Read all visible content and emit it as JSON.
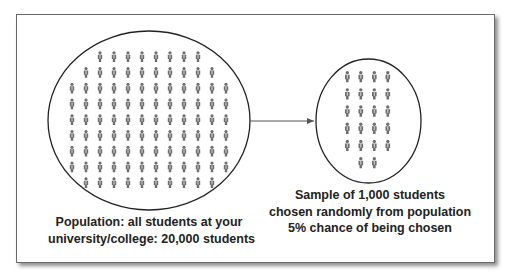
{
  "diagram": {
    "colors": {
      "frame_border": "#6a6a6a",
      "ellipse_stroke": "#222222",
      "arrow": "#555555",
      "figure": "#6e6e6e",
      "text": "#222222"
    },
    "population": {
      "icon": "person-icon",
      "rows": [
        8,
        10,
        12,
        12,
        12,
        12,
        12,
        12,
        10
      ],
      "caption_lines": [
        "Population: all students at your",
        "university/college: 20,000 students"
      ]
    },
    "arrow": {
      "icon": "arrow-right-icon",
      "direction": "population-to-sample"
    },
    "sample": {
      "icon": "person-icon",
      "rows": [
        4,
        4,
        4,
        4,
        4,
        2
      ],
      "caption_lines": [
        "Sample of 1,000 students",
        "chosen randomly from population",
        "5% chance of being chosen"
      ]
    }
  }
}
